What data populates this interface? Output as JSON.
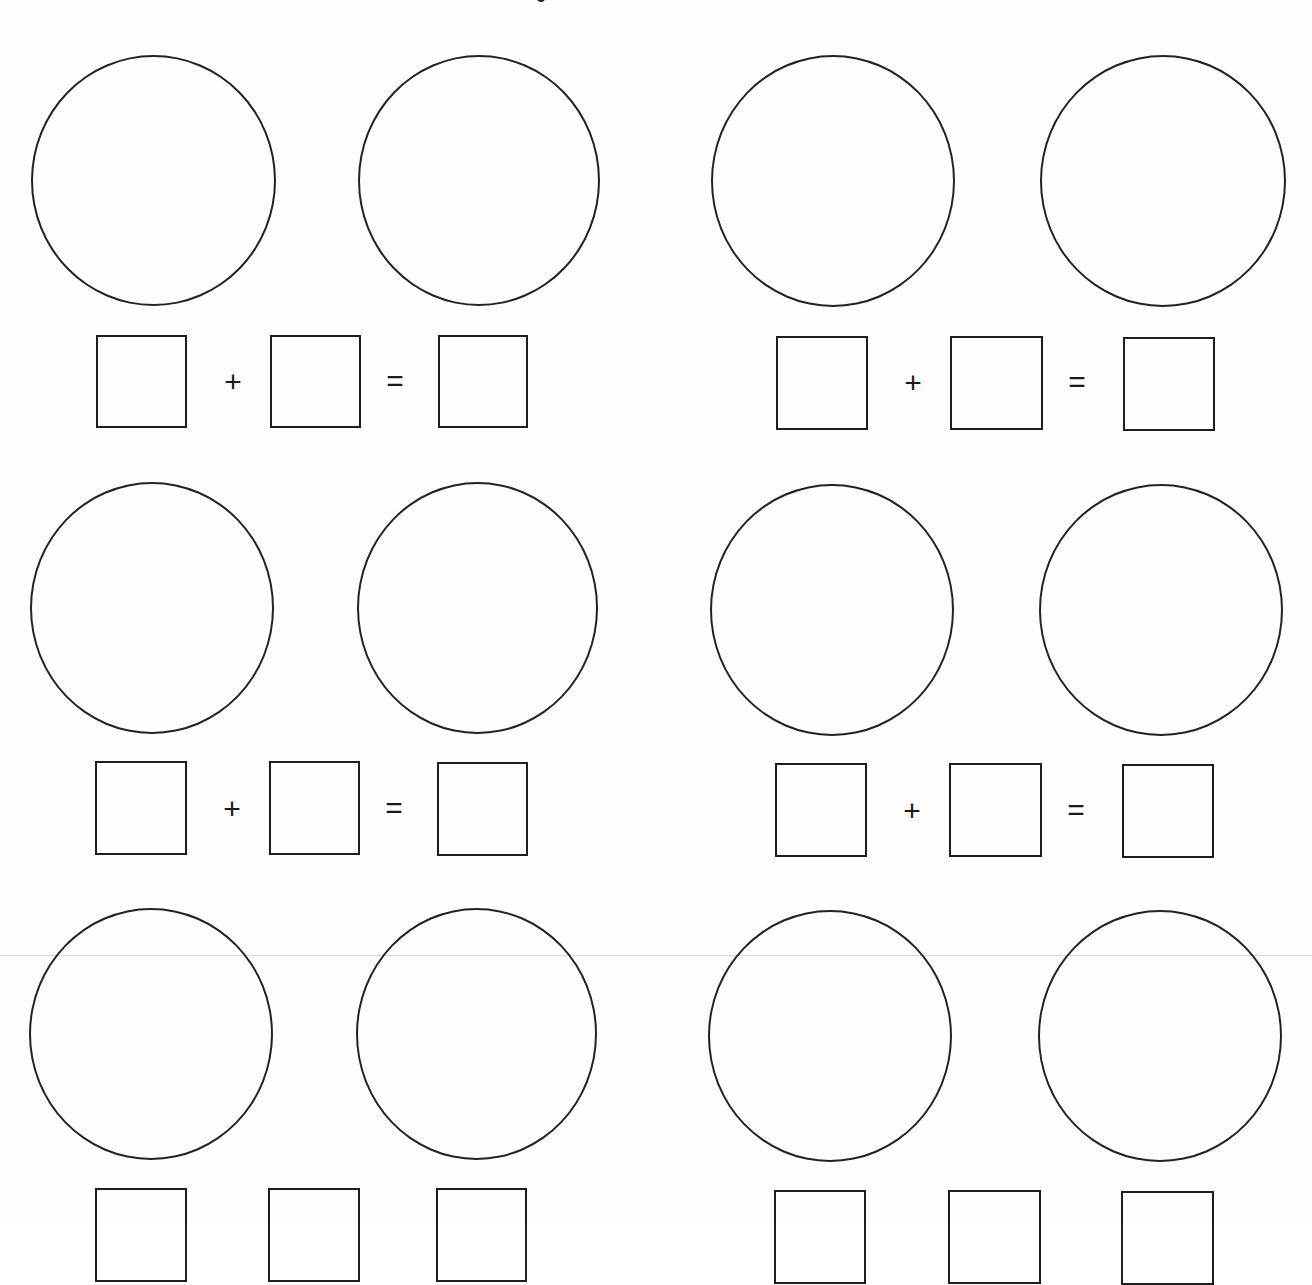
{
  "worksheet": {
    "type": "addition-worksheet",
    "problems": [
      {
        "id": 1,
        "row": 0,
        "col": 0,
        "operator": "+",
        "equals": "=",
        "answer_boxes": [
          "",
          "",
          ""
        ]
      },
      {
        "id": 2,
        "row": 0,
        "col": 1,
        "operator": "+",
        "equals": "=",
        "answer_boxes": [
          "",
          "",
          ""
        ]
      },
      {
        "id": 3,
        "row": 1,
        "col": 0,
        "operator": "+",
        "equals": "=",
        "answer_boxes": [
          "",
          "",
          ""
        ]
      },
      {
        "id": 4,
        "row": 1,
        "col": 1,
        "operator": "+",
        "equals": "=",
        "answer_boxes": [
          "",
          "",
          ""
        ]
      },
      {
        "id": 5,
        "row": 2,
        "col": 0,
        "operator": "+",
        "equals": "=",
        "answer_boxes": [
          "",
          "",
          ""
        ]
      },
      {
        "id": 6,
        "row": 2,
        "col": 1,
        "operator": "+",
        "equals": "=",
        "answer_boxes": [
          "",
          "",
          ""
        ]
      }
    ]
  },
  "colors": {
    "stroke": "#222222",
    "background": "#ffffff",
    "scan_artifact": "#d6d6d6"
  }
}
